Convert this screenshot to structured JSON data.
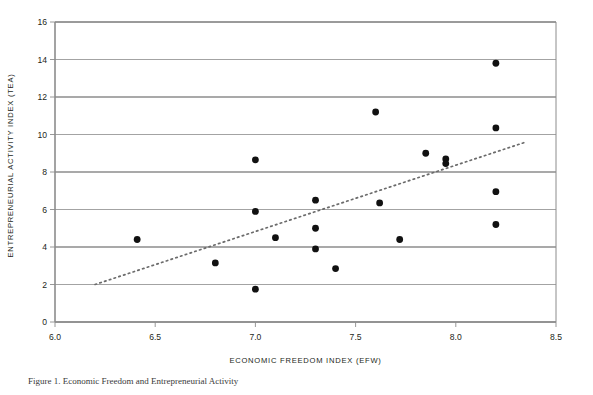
{
  "chart_data": {
    "type": "scatter",
    "title": "",
    "xlabel": "ECONOMIC FREEDOM INDEX (EFW)",
    "ylabel": "ENTREPRENEURIAL ACTIVITY INDEX (TEA)",
    "xlim": [
      6.0,
      8.5
    ],
    "ylim": [
      0,
      16
    ],
    "xticks": [
      "6.0",
      "6.5",
      "7.0",
      "7.5",
      "8.0",
      "8.5"
    ],
    "xtick_values": [
      6.0,
      6.5,
      7.0,
      7.5,
      8.0,
      8.5
    ],
    "yticks": [
      "0",
      "2",
      "4",
      "6",
      "8",
      "10",
      "12",
      "14",
      "16"
    ],
    "ytick_values": [
      0,
      2,
      4,
      6,
      8,
      10,
      12,
      14,
      16
    ],
    "grid": "horizontal",
    "legend": "none",
    "marker": "filled-circle",
    "marker_color": "#111111",
    "gridline_color": "#8c8c8c",
    "axis_color": "#8c8c8c",
    "points": [
      {
        "x": 6.41,
        "y": 4.4
      },
      {
        "x": 6.8,
        "y": 3.15
      },
      {
        "x": 7.0,
        "y": 8.65
      },
      {
        "x": 7.0,
        "y": 5.9
      },
      {
        "x": 7.0,
        "y": 1.75
      },
      {
        "x": 7.1,
        "y": 4.5
      },
      {
        "x": 7.3,
        "y": 6.5
      },
      {
        "x": 7.3,
        "y": 5.0
      },
      {
        "x": 7.3,
        "y": 3.9
      },
      {
        "x": 7.4,
        "y": 2.85
      },
      {
        "x": 7.6,
        "y": 11.2
      },
      {
        "x": 7.62,
        "y": 6.35
      },
      {
        "x": 7.72,
        "y": 4.4
      },
      {
        "x": 7.85,
        "y": 9.0
      },
      {
        "x": 7.95,
        "y": 8.7
      },
      {
        "x": 7.95,
        "y": 8.45
      },
      {
        "x": 8.2,
        "y": 13.8
      },
      {
        "x": 8.2,
        "y": 10.35
      },
      {
        "x": 8.2,
        "y": 6.95
      },
      {
        "x": 8.2,
        "y": 5.2
      }
    ],
    "trendline": {
      "style": "dotted",
      "color": "#6b6b6b",
      "x_start": 6.2,
      "y_start": 2.0,
      "x_end": 8.35,
      "y_end": 9.6
    }
  },
  "caption": {
    "text": "Figure 1. Economic Freedom and Entrepreneurial Activity"
  }
}
